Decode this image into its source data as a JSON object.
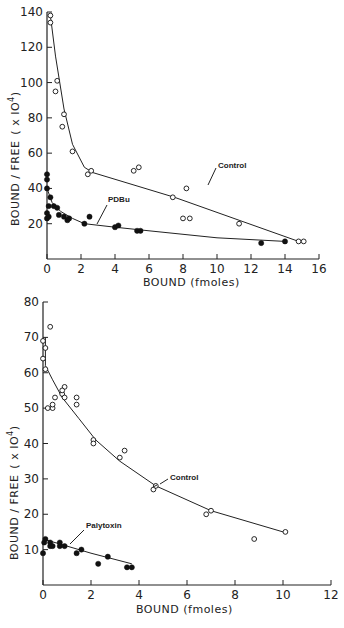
{
  "chart_data": [
    {
      "type": "scatter",
      "title": "",
      "xlabel": "BOUND (fmoles)",
      "ylabel": "BOUND / FREE (x10^4)",
      "xlim": [
        0,
        16
      ],
      "ylim": [
        0,
        140
      ],
      "xticks": [
        0,
        2,
        4,
        6,
        8,
        10,
        12,
        14,
        16
      ],
      "yticks": [
        20,
        40,
        60,
        80,
        100,
        120,
        140
      ],
      "grid": false,
      "legend": "none (inline annotations)",
      "series": [
        {
          "name": "Control",
          "marker": "open-circle",
          "points": [
            [
              0.2,
              138
            ],
            [
              0.2,
              134
            ],
            [
              0.6,
              101
            ],
            [
              0.5,
              95
            ],
            [
              1.0,
              82
            ],
            [
              0.9,
              75
            ],
            [
              1.5,
              61
            ],
            [
              2.4,
              48
            ],
            [
              2.6,
              50
            ],
            [
              5.1,
              50
            ],
            [
              5.4,
              52
            ],
            [
              7.4,
              35
            ],
            [
              8.2,
              40
            ],
            [
              8.0,
              23
            ],
            [
              8.4,
              23
            ],
            [
              11.3,
              20
            ],
            [
              14.8,
              10
            ],
            [
              15.1,
              10
            ]
          ],
          "fit_line": [
            [
              0.2,
              138
            ],
            [
              0.5,
              115
            ],
            [
              1.0,
              85
            ],
            [
              1.5,
              65
            ],
            [
              2.2,
              52
            ],
            [
              2.7,
              49
            ],
            [
              7.5,
              35
            ],
            [
              14.8,
              10
            ]
          ]
        },
        {
          "name": "PDBu",
          "marker": "filled-circle",
          "points": [
            [
              0.0,
              48
            ],
            [
              0.0,
              45
            ],
            [
              0.0,
              40
            ],
            [
              0.0,
              26
            ],
            [
              0.0,
              23
            ],
            [
              0.1,
              24
            ],
            [
              0.1,
              30
            ],
            [
              0.2,
              35
            ],
            [
              0.4,
              30
            ],
            [
              0.6,
              29
            ],
            [
              0.7,
              25
            ],
            [
              1.0,
              24
            ],
            [
              1.2,
              22
            ],
            [
              1.3,
              23
            ],
            [
              2.2,
              20
            ],
            [
              2.5,
              24
            ],
            [
              4.0,
              18
            ],
            [
              4.2,
              19
            ],
            [
              5.3,
              16
            ],
            [
              5.5,
              16
            ],
            [
              12.6,
              9
            ],
            [
              14.0,
              10
            ]
          ],
          "fit_line": [
            [
              0.0,
              40
            ],
            [
              0.3,
              32
            ],
            [
              0.8,
              27
            ],
            [
              1.5,
              23
            ],
            [
              2.2,
              20
            ],
            [
              4.0,
              18
            ],
            [
              6.0,
              16
            ],
            [
              10.0,
              12
            ],
            [
              14.0,
              10
            ]
          ]
        }
      ],
      "annotations": [
        {
          "text": "Control",
          "x": 9.2,
          "y": 48
        },
        {
          "text": "PDBu",
          "x": 4.6,
          "y": 35
        }
      ]
    },
    {
      "type": "scatter",
      "title": "",
      "xlabel": "BOUND (fmoles)",
      "ylabel": "BOUND / FREE (x10^4)",
      "xlim": [
        0,
        12
      ],
      "ylim": [
        0,
        80
      ],
      "xticks": [
        0,
        2,
        4,
        6,
        8,
        10,
        12
      ],
      "yticks": [
        10,
        20,
        30,
        40,
        50,
        60,
        70,
        80
      ],
      "grid": false,
      "legend": "none (inline annotations)",
      "series": [
        {
          "name": "Control",
          "marker": "open-circle",
          "points": [
            [
              0.0,
              69
            ],
            [
              0.1,
              67
            ],
            [
              0.3,
              73
            ],
            [
              0.0,
              64
            ],
            [
              0.1,
              61
            ],
            [
              0.2,
              50
            ],
            [
              0.4,
              50
            ],
            [
              0.4,
              51
            ],
            [
              0.5,
              53
            ],
            [
              0.9,
              56
            ],
            [
              0.8,
              54
            ],
            [
              0.8,
              55
            ],
            [
              0.9,
              53
            ],
            [
              1.4,
              53
            ],
            [
              1.4,
              51
            ],
            [
              2.1,
              41
            ],
            [
              2.1,
              40
            ],
            [
              3.2,
              36
            ],
            [
              3.4,
              38
            ],
            [
              4.6,
              27
            ],
            [
              4.7,
              28
            ],
            [
              6.8,
              20
            ],
            [
              7.0,
              21
            ],
            [
              8.8,
              13
            ],
            [
              10.1,
              15
            ]
          ],
          "fit_line": [
            [
              0.1,
              70
            ],
            [
              0.1,
              62
            ],
            [
              0.4,
              58
            ],
            [
              0.8,
              53
            ],
            [
              1.5,
              47
            ],
            [
              2.2,
              41
            ],
            [
              3.2,
              35
            ],
            [
              4.7,
              28
            ],
            [
              7.0,
              21
            ],
            [
              10.0,
              15
            ]
          ]
        },
        {
          "name": "Polytoxin",
          "marker": "filled-circle",
          "points": [
            [
              0.0,
              9
            ],
            [
              0.05,
              12
            ],
            [
              0.1,
              13
            ],
            [
              0.3,
              12
            ],
            [
              0.3,
              11
            ],
            [
              0.4,
              11
            ],
            [
              0.7,
              12
            ],
            [
              0.7,
              11
            ],
            [
              0.9,
              11
            ],
            [
              1.4,
              9
            ],
            [
              1.6,
              10
            ],
            [
              2.3,
              6
            ],
            [
              2.7,
              8
            ],
            [
              3.5,
              5
            ],
            [
              3.7,
              5
            ]
          ],
          "fit_line": [
            [
              0.0,
              13
            ],
            [
              1.0,
              11
            ],
            [
              2.0,
              9
            ],
            [
              3.7,
              6
            ]
          ]
        }
      ],
      "annotations": [
        {
          "text": "Control",
          "x": 5.6,
          "y": 30
        },
        {
          "text": "Palytoxin",
          "x": 1.8,
          "y": 17
        }
      ]
    }
  ],
  "charts": [
    {
      "ylabel_main": "BOUND / FREE",
      "ylabel_unit": "( x IO",
      "ylabel_exp": "4",
      "ylabel_close": ")",
      "xlabel": "BOUND  (fmoles)",
      "annot_control": "Control",
      "annot_treat": "PDBu"
    },
    {
      "ylabel_main": "BOUND / FREE",
      "ylabel_unit": "( x IO",
      "ylabel_exp": "4",
      "ylabel_close": ")",
      "xlabel": "BOUND  (fmoles)",
      "annot_control": "Control",
      "annot_treat": "Palytoxin"
    }
  ]
}
